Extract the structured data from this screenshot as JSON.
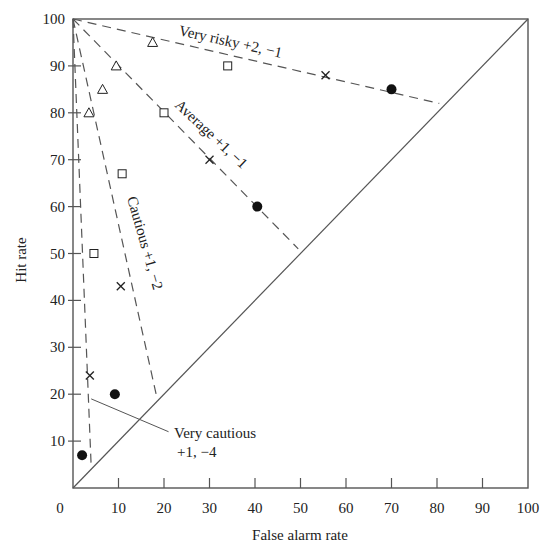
{
  "chart_data": {
    "type": "scatter",
    "title": "",
    "xlabel": "False alarm rate",
    "ylabel": "Hit rate",
    "xlim": [
      0,
      100
    ],
    "ylim": [
      0,
      100
    ],
    "grid": false,
    "legend": "none (series labelled inline on curves)",
    "x_ticks": [
      0,
      10,
      20,
      30,
      40,
      50,
      60,
      70,
      80,
      90,
      100
    ],
    "y_ticks": [
      10,
      20,
      30,
      40,
      50,
      60,
      70,
      80,
      90,
      100
    ],
    "chance_line": {
      "from": [
        0,
        0
      ],
      "to": [
        100,
        100
      ],
      "style": "solid"
    },
    "criterion_lines": [
      {
        "name": "Very risky",
        "payoff": "+2, −1",
        "label": "Very risky +2, −1",
        "from": [
          0,
          100
        ],
        "to": [
          80.5,
          82
        ],
        "style": "dashed"
      },
      {
        "name": "Average",
        "payoff": "+1, −1",
        "label": "Average +1, −1",
        "from": [
          0,
          100
        ],
        "to": [
          49.5,
          51
        ],
        "style": "dashed"
      },
      {
        "name": "Cautious",
        "payoff": "+1, −2",
        "label": "Cautious +1, −2",
        "from": [
          0,
          100
        ],
        "to": [
          18.5,
          19
        ],
        "style": "dashed"
      },
      {
        "name": "Very cautious",
        "payoff": "+1, −4",
        "label": "Very cautious +1, −4",
        "from": [
          0,
          100
        ],
        "to": [
          4,
          4.5
        ],
        "style": "dashed"
      }
    ],
    "series": [
      {
        "name": "triangles",
        "marker": "triangle-open",
        "points": [
          [
            17.5,
            95
          ],
          [
            9.5,
            90
          ],
          [
            6.5,
            85
          ],
          [
            3.5,
            80
          ]
        ]
      },
      {
        "name": "squares",
        "marker": "square-open",
        "points": [
          [
            34,
            90
          ],
          [
            20,
            80
          ],
          [
            10.8,
            67
          ],
          [
            4.6,
            50
          ]
        ]
      },
      {
        "name": "crosses",
        "marker": "cross",
        "points": [
          [
            55.5,
            88
          ],
          [
            30,
            70
          ],
          [
            10.5,
            43
          ],
          [
            3.7,
            24
          ]
        ]
      },
      {
        "name": "dots",
        "marker": "circle-filled",
        "points": [
          [
            70,
            85
          ],
          [
            40.5,
            60
          ],
          [
            9.2,
            20
          ],
          [
            2,
            7
          ]
        ]
      }
    ],
    "annotations": [
      {
        "text_lines": [
          "Very cautious",
          "+1, −4"
        ],
        "leader_from": [
          4,
          19
        ],
        "leader_to": [
          21,
          12
        ]
      }
    ]
  },
  "labels": {
    "x_axis_title": "False alarm rate",
    "y_axis_title": "Hit rate",
    "very_risky": "Very risky +2, −1",
    "average": "Average +1, −1",
    "cautious": "Cautious +1, −2",
    "very_cautious_line1": "Very cautious",
    "very_cautious_line2": "+1, −4",
    "origin": "0",
    "x_ticks": [
      "10",
      "20",
      "30",
      "40",
      "50",
      "60",
      "70",
      "80",
      "90",
      "100"
    ],
    "y_ticks": [
      "10",
      "20",
      "30",
      "40",
      "50",
      "60",
      "70",
      "80",
      "90",
      "100"
    ]
  },
  "colors": {
    "ink": "#222222",
    "line": "#555555",
    "background": "#ffffff"
  }
}
